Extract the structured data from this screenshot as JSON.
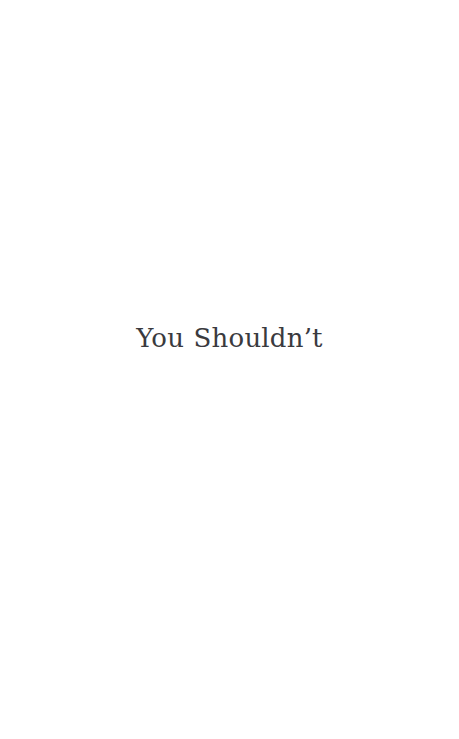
{
  "page": {
    "background_color": "#ffffff",
    "width": 459,
    "height": 739
  },
  "content": {
    "title": "You Shouldn’t",
    "title_color": "#3a3a3e"
  }
}
